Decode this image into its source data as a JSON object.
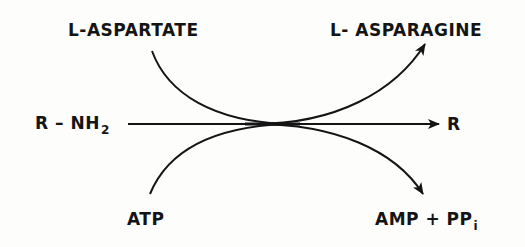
{
  "diagram": {
    "type": "biochemical-reaction-scheme",
    "stroke_color": "#141414",
    "background_color": "#fdfdfc",
    "main_reaction": {
      "substrate": {
        "text": "R – NH",
        "subscript": "2"
      },
      "product": {
        "text": "R"
      }
    },
    "coupled_inputs": {
      "top": {
        "text": "L-ASPARTATE"
      },
      "bottom": {
        "text": "ATP"
      }
    },
    "coupled_outputs": {
      "top": {
        "text": "L- ASPARAGINE"
      },
      "bottom": {
        "text": "AMP + PP",
        "subscript": "i"
      }
    }
  }
}
